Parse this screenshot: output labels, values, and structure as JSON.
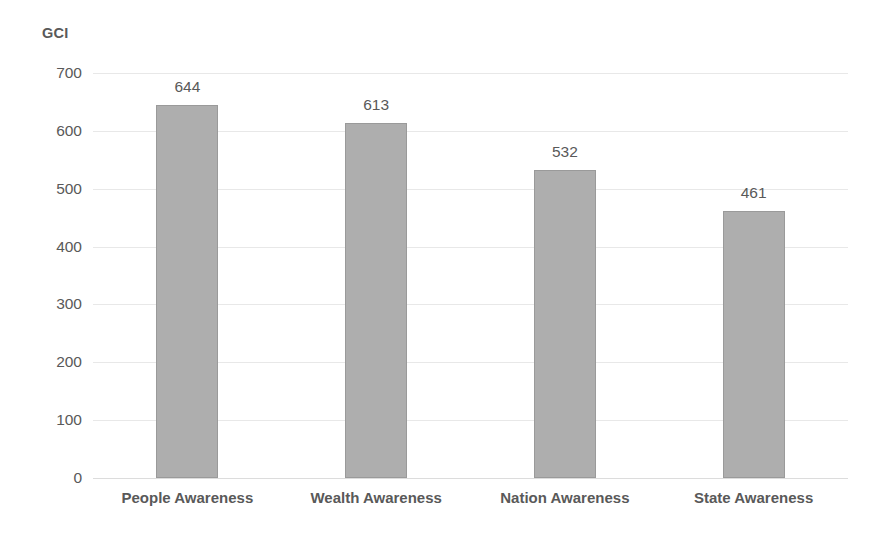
{
  "chart_data": {
    "type": "bar",
    "title": "",
    "ylabel": "GCI",
    "xlabel": "",
    "categories": [
      "People Awareness",
      "Wealth Awareness",
      "Nation Awareness",
      "State Awareness"
    ],
    "values": [
      644,
      613,
      532,
      461
    ],
    "value_labels": [
      "644",
      "613",
      "532",
      "461"
    ],
    "ylim": [
      0,
      700
    ],
    "yticks": [
      700,
      600,
      500,
      400,
      300,
      200,
      100,
      0
    ],
    "ytick_labels": [
      "700",
      "600",
      "500",
      "400",
      "300",
      "200",
      "100",
      "0"
    ],
    "grid": true,
    "legend": null,
    "bar_color": "#aeaeae",
    "bar_border_color": "#9a9a9a",
    "text_color": "#595959",
    "gridline_color": "#e8e8e8",
    "background": "#ffffff"
  }
}
